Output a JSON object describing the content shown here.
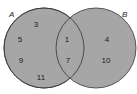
{
  "diagram": {
    "type": "venn",
    "fill_color": "#a6a6a6",
    "stroke_color": "#333333",
    "sets": [
      {
        "name": "A",
        "only": [
          "3",
          "5",
          "9",
          "11"
        ]
      },
      {
        "name": "B",
        "only": [
          "4",
          "10"
        ]
      }
    ],
    "intersection": [
      "1",
      "7"
    ]
  }
}
